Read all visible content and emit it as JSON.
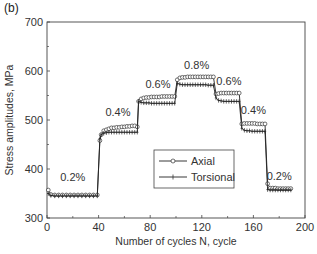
{
  "panel_label": "(b)",
  "chart_data": {
    "type": "line",
    "title": "",
    "xlabel": "Number of cycles N, cycle",
    "ylabel": "Stress amplitudes, MPa",
    "xlim": [
      0,
      200
    ],
    "ylim": [
      300,
      700
    ],
    "xticks": [
      0,
      40,
      80,
      120,
      160,
      200
    ],
    "yticks": [
      300,
      400,
      500,
      600,
      700
    ],
    "grid": false,
    "legend_position": "lower-center-right (inside plot)",
    "series": [
      {
        "name": "Axial",
        "marker": "open-circle",
        "x": [
          1,
          3,
          6,
          9,
          12,
          15,
          18,
          21,
          24,
          27,
          30,
          33,
          36,
          39,
          41,
          42,
          44,
          46,
          48,
          50,
          52,
          54,
          56,
          58,
          60,
          62,
          64,
          66,
          68,
          70,
          71,
          73,
          75,
          77,
          79,
          81,
          83,
          85,
          87,
          89,
          91,
          93,
          95,
          97,
          99,
          101,
          103,
          105,
          107,
          109,
          111,
          113,
          115,
          117,
          119,
          121,
          123,
          125,
          127,
          129,
          131,
          133,
          135,
          137,
          139,
          141,
          143,
          145,
          147,
          149,
          151,
          153,
          155,
          157,
          159,
          161,
          163,
          165,
          167,
          169,
          171,
          173,
          175,
          177,
          179,
          181,
          183,
          185,
          187,
          189
        ],
        "values": [
          357,
          348,
          347,
          347,
          347,
          347,
          347,
          347,
          347,
          347,
          347,
          347,
          347,
          347,
          458,
          470,
          478,
          480,
          482,
          484,
          484,
          485,
          485,
          486,
          486,
          487,
          487,
          488,
          488,
          486,
          538,
          543,
          545,
          546,
          546,
          547,
          547,
          547,
          547,
          548,
          548,
          548,
          548,
          548,
          548,
          582,
          586,
          587,
          587,
          588,
          588,
          588,
          588,
          588,
          588,
          588,
          588,
          588,
          588,
          588,
          553,
          554,
          555,
          555,
          555,
          555,
          555,
          555,
          555,
          555,
          492,
          493,
          493,
          493,
          493,
          493,
          492,
          492,
          492,
          492,
          370,
          361,
          361,
          361,
          360,
          360,
          360,
          360,
          360,
          360
        ]
      },
      {
        "name": "Torsional",
        "marker": "plus",
        "x": [
          1,
          3,
          6,
          9,
          12,
          15,
          18,
          21,
          24,
          27,
          30,
          33,
          36,
          39,
          41,
          42,
          44,
          46,
          48,
          50,
          52,
          54,
          56,
          58,
          60,
          62,
          64,
          66,
          68,
          70,
          71,
          73,
          75,
          77,
          79,
          81,
          83,
          85,
          87,
          89,
          91,
          93,
          95,
          97,
          99,
          101,
          103,
          105,
          107,
          109,
          111,
          113,
          115,
          117,
          119,
          121,
          123,
          125,
          127,
          129,
          131,
          133,
          135,
          137,
          139,
          141,
          143,
          145,
          147,
          149,
          151,
          153,
          155,
          157,
          159,
          161,
          163,
          165,
          167,
          169,
          171,
          173,
          175,
          177,
          179,
          181,
          183,
          185,
          187,
          189
        ],
        "values": [
          350,
          346,
          345,
          345,
          345,
          345,
          345,
          345,
          345,
          345,
          345,
          345,
          345,
          345,
          462,
          470,
          473,
          474,
          475,
          475,
          475,
          475,
          475,
          475,
          475,
          475,
          475,
          475,
          475,
          475,
          538,
          536,
          535,
          535,
          535,
          534,
          534,
          534,
          534,
          534,
          534,
          534,
          534,
          534,
          534,
          575,
          573,
          572,
          572,
          572,
          572,
          572,
          572,
          572,
          572,
          572,
          572,
          571,
          571,
          571,
          545,
          540,
          539,
          538,
          538,
          538,
          538,
          538,
          538,
          538,
          483,
          479,
          478,
          478,
          477,
          477,
          477,
          477,
          477,
          477,
          358,
          357,
          357,
          357,
          357,
          357,
          357,
          357,
          357,
          357
        ]
      }
    ],
    "annotations": [
      {
        "text": "0.2%",
        "x": 20,
        "y": 375
      },
      {
        "text": "0.4%",
        "x": 55,
        "y": 508
      },
      {
        "text": "0.6%",
        "x": 86,
        "y": 566
      },
      {
        "text": "0.8%",
        "x": 116,
        "y": 605
      },
      {
        "text": "0.6%",
        "x": 141,
        "y": 572
      },
      {
        "text": "0.4%",
        "x": 160,
        "y": 512
      },
      {
        "text": "0.2%",
        "x": 180,
        "y": 378
      }
    ]
  }
}
